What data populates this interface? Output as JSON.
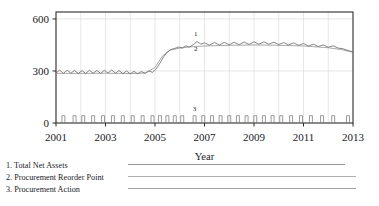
{
  "chart_data": {
    "type": "line",
    "title": "",
    "xlabel": "Year",
    "ylabel": "",
    "xlim": [
      2001,
      2013
    ],
    "ylim": [
      0,
      640
    ],
    "grid": true,
    "legend_position": "below",
    "x_ticks": [
      "2001",
      "2003",
      "2005",
      "2007",
      "2009",
      "2011",
      "2013"
    ],
    "x_tick_values": [
      2001,
      2003,
      2005,
      2007,
      2009,
      2011,
      2013
    ],
    "y_ticks": [
      "0",
      "300",
      "600"
    ],
    "y_tick_values": [
      0,
      300,
      600
    ],
    "annotations": [
      {
        "text": "1",
        "x": 2006.65,
        "y": 500,
        "series": "Total Net Assets"
      },
      {
        "text": "2",
        "x": 2006.65,
        "y": 418,
        "series": "Procurement Reorder Point"
      },
      {
        "text": "3",
        "x": 2006.6,
        "y": 72,
        "series": "Procurement Action"
      }
    ],
    "series": [
      {
        "name": "Total Net Assets",
        "legend_index": 1,
        "color": "#6a6a68",
        "x": [
          2001.0,
          2001.15,
          2001.3,
          2001.45,
          2001.6,
          2001.75,
          2001.9,
          2002.05,
          2002.2,
          2002.35,
          2002.5,
          2002.65,
          2002.8,
          2002.95,
          2003.1,
          2003.25,
          2003.4,
          2003.55,
          2003.7,
          2003.85,
          2004.0,
          2004.15,
          2004.3,
          2004.45,
          2004.6,
          2004.75,
          2004.9,
          2005.05,
          2005.2,
          2005.35,
          2005.5,
          2005.65,
          2005.8,
          2005.95,
          2006.1,
          2006.25,
          2006.4,
          2006.55,
          2006.7,
          2006.85,
          2007.0,
          2007.2,
          2007.4,
          2007.6,
          2007.8,
          2008.0,
          2008.2,
          2008.4,
          2008.6,
          2008.8,
          2009.0,
          2009.2,
          2009.4,
          2009.6,
          2009.8,
          2010.0,
          2010.2,
          2010.4,
          2010.6,
          2010.8,
          2011.0,
          2011.2,
          2011.4,
          2011.6,
          2011.8,
          2012.0,
          2012.2,
          2012.4,
          2012.6,
          2012.8,
          2013.0
        ],
        "y": [
          288,
          305,
          286,
          304,
          287,
          303,
          285,
          302,
          286,
          304,
          287,
          303,
          286,
          304,
          288,
          306,
          287,
          302,
          285,
          300,
          284,
          298,
          283,
          297,
          286,
          300,
          292,
          312,
          345,
          382,
          410,
          424,
          430,
          438,
          432,
          445,
          438,
          452,
          470,
          455,
          462,
          449,
          464,
          450,
          465,
          451,
          466,
          452,
          467,
          453,
          468,
          454,
          468,
          454,
          466,
          452,
          464,
          450,
          462,
          448,
          458,
          444,
          454,
          441,
          450,
          437,
          445,
          432,
          428,
          418,
          410
        ]
      },
      {
        "name": "Procurement Reorder Point",
        "legend_index": 2,
        "color": "#8c8c8a",
        "x": [
          2001.0,
          2002.0,
          2003.0,
          2004.0,
          2004.6,
          2005.0,
          2005.3,
          2005.6,
          2006.0,
          2006.5,
          2007.0,
          2008.0,
          2009.0,
          2010.0,
          2011.0,
          2012.0,
          2012.5,
          2013.0
        ],
        "y": [
          286,
          286,
          287,
          285,
          288,
          320,
          385,
          420,
          432,
          440,
          444,
          448,
          450,
          448,
          444,
          434,
          424,
          408
        ]
      },
      {
        "name": "Procurement Action",
        "legend_index": 3,
        "color": "#7a7a78",
        "type": "pulse",
        "pulse_height": 42,
        "pulse_width": 0.12,
        "x": [
          2001.3,
          2001.75,
          2002.1,
          2002.5,
          2002.9,
          2003.3,
          2003.7,
          2004.1,
          2004.5,
          2004.9,
          2005.2,
          2005.5,
          2005.8,
          2006.1,
          2006.6,
          2006.95,
          2007.3,
          2007.65,
          2008.0,
          2008.35,
          2008.7,
          2009.05,
          2009.4,
          2009.75,
          2010.1,
          2010.5,
          2010.9,
          2011.3,
          2011.75,
          2012.2,
          2012.8
        ]
      }
    ]
  },
  "legend": {
    "items": [
      {
        "label": "1. Total Net Assets"
      },
      {
        "label": "2. Procurement Reorder Point"
      },
      {
        "label": "3. Procurement Action"
      }
    ]
  }
}
